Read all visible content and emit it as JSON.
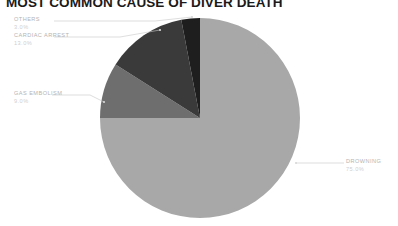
{
  "chart_data": {
    "type": "pie",
    "title": "MOST COMMON CAUSE OF DIVER DEATH",
    "xlabel": "",
    "ylabel": "",
    "legend_position": "callout-labels",
    "grid": false,
    "categories": [
      "DROWNING",
      "CARDIAC ARREST",
      "GAS EMBOLISM",
      "OTHERS"
    ],
    "values": [
      75.0,
      13.0,
      9.0,
      3.0
    ],
    "labels_pct": [
      "75.0%",
      "13.0%",
      "9.0%",
      "3.0%"
    ],
    "colors": [
      "#a8a8a8",
      "#3a3a3a",
      "#6e6e6e",
      "#1e1e1e"
    ],
    "slices": [
      {
        "name": "DROWNING",
        "value": 75.0,
        "pct": "75.0%",
        "color": "#a8a8a8"
      },
      {
        "name": "CARDIAC ARREST",
        "value": 13.0,
        "pct": "13.0%",
        "color": "#3a3a3a"
      },
      {
        "name": "GAS EMBOLISM",
        "value": 9.0,
        "pct": "9.0%",
        "color": "#6e6e6e"
      },
      {
        "name": "OTHERS",
        "value": 3.0,
        "pct": "3.0%",
        "color": "#1e1e1e"
      }
    ]
  },
  "callouts": {
    "others": {
      "name": "OTHERS",
      "pct": "3.0%"
    },
    "cardiac_arrest": {
      "name": "CARDIAC ARREST",
      "pct": "13.0%"
    },
    "gas_embolism": {
      "name": "GAS EMBOLISM",
      "pct": "9.0%"
    },
    "drowning": {
      "name": "DROWNING",
      "pct": "75.0%"
    }
  },
  "style": {
    "background": "#ffffff",
    "title_color": "#1a1a1a",
    "label_color": "#b4b4b4",
    "pct_color": "#cfcfcf",
    "leader_line_color": "#c8c8c8"
  }
}
